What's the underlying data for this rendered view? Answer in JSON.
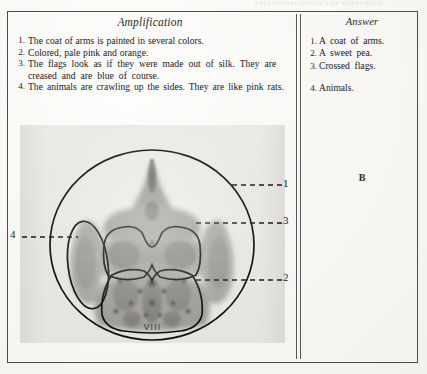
{
  "page": {
    "running_head": "PSYCHODIAGNOSTICS  OF  RORSCHACH",
    "plate_letter": "B"
  },
  "amplification": {
    "heading": "Amplification",
    "items": [
      {
        "num": "1.",
        "text": "The coat of arms is painted in several colors."
      },
      {
        "num": "2.",
        "text": "Colored, pale pink and orange."
      },
      {
        "num": "3.",
        "text": "The flags look as if they were made out of silk. They are creased and are blue of course."
      },
      {
        "num": "4.",
        "text": "The animals are crawling up the sides. They are like pink rats."
      }
    ]
  },
  "answer": {
    "heading": "Answer",
    "items": [
      {
        "num": "1.",
        "text": "A coat of arms."
      },
      {
        "num": "2.",
        "text": "A sweet pea."
      },
      {
        "num": "3.",
        "text": "Crossed flags."
      },
      {
        "num": "4.",
        "text": "Animals."
      }
    ]
  },
  "plate": {
    "roman_numeral": "VIII",
    "leader_labels": [
      {
        "id": "1",
        "text": "1"
      },
      {
        "id": "3",
        "text": "3"
      },
      {
        "id": "2",
        "text": "2"
      },
      {
        "id": "4",
        "text": "4"
      }
    ]
  },
  "colors": {
    "ink": "#20201f",
    "rule": "#4b4b4b",
    "plate_bg": "#eceae6",
    "blot_mid": "#8e8c88",
    "blot_dark": "#58565 3"
  }
}
